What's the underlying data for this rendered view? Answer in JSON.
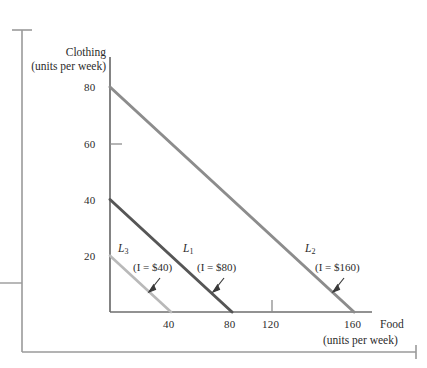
{
  "chart_data": {
    "type": "line",
    "title": "",
    "subtitle": "",
    "xlabel": "Food",
    "xlabel_units": "(units per week)",
    "ylabel": "Clothing",
    "ylabel_units": "(units per week)",
    "xlim": [
      0,
      180
    ],
    "ylim": [
      0,
      90
    ],
    "xticks": [
      40,
      80,
      120,
      160
    ],
    "yticks": [
      20,
      40,
      60,
      80
    ],
    "xtick_labels": [
      "40",
      "80",
      "120",
      "160"
    ],
    "ytick_labels": [
      "20",
      "40",
      "60",
      "80"
    ],
    "grid": false,
    "legend_position": "inline-annotations",
    "series": [
      {
        "name": "L3",
        "label": "L",
        "label_sub": "3",
        "annotation": "(I = $40)",
        "income": 40,
        "color": "#b9b9b9",
        "width": 2.6,
        "x": [
          0,
          40
        ],
        "y": [
          20,
          0
        ],
        "label_pos": {
          "x": 118,
          "y": 244
        },
        "annotation_pos": {
          "x": 133,
          "y": 263
        },
        "arrow": {
          "x1": 160,
          "y1": 279,
          "x2": 148,
          "y2": 293
        }
      },
      {
        "name": "L1",
        "label": "L",
        "label_sub": "1",
        "annotation": "(I = $80)",
        "income": 80,
        "color": "#565656",
        "width": 3.0,
        "x": [
          0,
          80
        ],
        "y": [
          40,
          0
        ],
        "label_pos": {
          "x": 183,
          "y": 244
        },
        "annotation_pos": {
          "x": 197,
          "y": 263
        },
        "arrow": {
          "x1": 224,
          "y1": 279,
          "x2": 212,
          "y2": 293
        }
      },
      {
        "name": "L2",
        "label": "L",
        "label_sub": "2",
        "annotation": "(I = $160)",
        "income": 160,
        "color": "#8c8c8c",
        "width": 3.0,
        "x": [
          0,
          160
        ],
        "y": [
          80,
          0
        ],
        "label_pos": {
          "x": 305,
          "y": 244
        },
        "annotation_pos": {
          "x": 315,
          "y": 263
        },
        "arrow": {
          "x1": 344,
          "y1": 279,
          "x2": 332,
          "y2": 293
        }
      }
    ],
    "axis_color": "#6e6e6e",
    "text_color": "#2b2b2b",
    "page_frame_color": "#9a9a9a"
  }
}
